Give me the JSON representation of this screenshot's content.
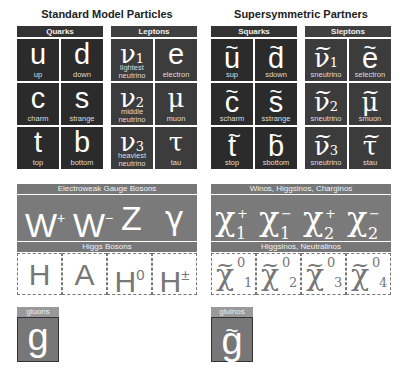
{
  "standard": {
    "title": "Standard Model Particles",
    "quarks_header": "Quarks",
    "leptons_header": "Leptons",
    "quarks": [
      {
        "symbol": "u",
        "name": "up"
      },
      {
        "symbol": "d",
        "name": "down"
      },
      {
        "symbol": "c",
        "name": "charm"
      },
      {
        "symbol": "s",
        "name": "strange"
      },
      {
        "symbol": "t",
        "name": "top"
      },
      {
        "symbol": "b",
        "name": "bottom"
      }
    ],
    "leptons": [
      {
        "symbol": "ν",
        "sub": "1",
        "name1": "lightest",
        "name2": "neutrino"
      },
      {
        "symbol": "e",
        "name1": "",
        "name2": "electron"
      },
      {
        "symbol": "ν",
        "sub": "2",
        "name1": "middle",
        "name2": "neutrino"
      },
      {
        "symbol": "μ",
        "name1": "",
        "name2": "muon"
      },
      {
        "symbol": "ν",
        "sub": "3",
        "name1": "heaviest",
        "name2": "neutrino"
      },
      {
        "symbol": "τ",
        "name1": "",
        "name2": "tau"
      }
    ],
    "gauge_header": "Electroweak Gauge Bosons",
    "gauge": [
      {
        "symbol": "W",
        "sup": "+"
      },
      {
        "symbol": "W",
        "sup": "−"
      },
      {
        "symbol": "Z",
        "sup": ""
      },
      {
        "symbol": "γ",
        "sup": ""
      }
    ],
    "higgs_header": "Higgs Bosons",
    "higgs": [
      {
        "symbol": "H",
        "sup": ""
      },
      {
        "symbol": "A",
        "sup": ""
      },
      {
        "symbol": "H",
        "sup": "0"
      },
      {
        "symbol": "H",
        "sup": "±"
      }
    ],
    "gluon_label": "gluons",
    "gluon_symbol": "g"
  },
  "susy": {
    "title": "Supersymmetric Partners",
    "squarks_header": "Squarks",
    "sleptons_header": "Sleptons",
    "squarks": [
      {
        "symbol": "u",
        "name": "sup"
      },
      {
        "symbol": "d",
        "name": "sdown"
      },
      {
        "symbol": "c",
        "name": "scharm"
      },
      {
        "symbol": "s",
        "name": "sstrange"
      },
      {
        "symbol": "t",
        "name": "stop"
      },
      {
        "symbol": "b",
        "name": "sbottom"
      }
    ],
    "sleptons": [
      {
        "symbol": "ν",
        "sub": "1",
        "name": "sneutrino"
      },
      {
        "symbol": "e",
        "name": "selectron"
      },
      {
        "symbol": "ν",
        "sub": "2",
        "name": "sneutrino"
      },
      {
        "symbol": "μ",
        "name": "smuon"
      },
      {
        "symbol": "ν",
        "sub": "3",
        "name": "sneutrino"
      },
      {
        "symbol": "τ",
        "name": "stau"
      }
    ],
    "charginos_header": "Winos, Higgsinos, Charginos",
    "charginos": [
      {
        "symbol": "χ",
        "sup": "+",
        "sub": "1"
      },
      {
        "symbol": "χ",
        "sup": "−",
        "sub": "1"
      },
      {
        "symbol": "χ",
        "sup": "+",
        "sub": "2"
      },
      {
        "symbol": "χ",
        "sup": "−",
        "sub": "2"
      }
    ],
    "neutralinos_header": "Higgsinos, Neutralinos",
    "neutralinos": [
      {
        "symbol": "χ",
        "sup": "0",
        "sub": "1"
      },
      {
        "symbol": "χ",
        "sup": "0",
        "sub": "2"
      },
      {
        "symbol": "χ",
        "sup": "0",
        "sub": "3"
      },
      {
        "symbol": "χ",
        "sup": "0",
        "sub": "4"
      }
    ],
    "gluino_label": "gluinos",
    "gluino_symbol": "g"
  }
}
